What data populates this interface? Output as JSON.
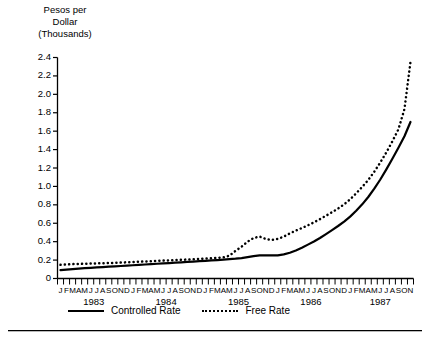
{
  "chart_data": {
    "type": "line",
    "title": "",
    "ylabel": "Pesos per Dollar (Thousands)",
    "ylabel_lines": "Pesos per\nDollar\n(Thousands)",
    "xlabel": "",
    "ylim": [
      0,
      2.4
    ],
    "ytick_labels": [
      "2.4",
      "2.2",
      "2.0",
      "1.8",
      "1.6",
      "1.4",
      "1.2",
      "1.0",
      "0.8",
      "0.6",
      "0.4",
      "0.2",
      "0"
    ],
    "ytick_values": [
      2.4,
      2.2,
      2.0,
      1.8,
      1.6,
      1.4,
      1.2,
      1.0,
      0.8,
      0.6,
      0.4,
      0.2,
      0
    ],
    "grid": false,
    "legend_position": "bottom",
    "month_letters": [
      "J",
      "F",
      "M",
      "A",
      "M",
      "J",
      "J",
      "A",
      "S",
      "O",
      "N",
      "D"
    ],
    "years": [
      "1983",
      "1984",
      "1985",
      "1986",
      "1987"
    ],
    "x_start": "1983-01",
    "x_end": "1987-11",
    "n_points": 59,
    "series": [
      {
        "name": "Controlled Rate",
        "style": "solid",
        "color": "#000000",
        "values": [
          0.09,
          0.096,
          0.102,
          0.107,
          0.112,
          0.116,
          0.12,
          0.124,
          0.128,
          0.132,
          0.136,
          0.14,
          0.144,
          0.148,
          0.152,
          0.156,
          0.16,
          0.164,
          0.168,
          0.172,
          0.176,
          0.18,
          0.184,
          0.188,
          0.192,
          0.196,
          0.2,
          0.205,
          0.21,
          0.215,
          0.222,
          0.232,
          0.243,
          0.252,
          0.252,
          0.252,
          0.252,
          0.262,
          0.28,
          0.305,
          0.335,
          0.368,
          0.402,
          0.44,
          0.482,
          0.525,
          0.57,
          0.618,
          0.672,
          0.735,
          0.805,
          0.885,
          0.975,
          1.075,
          1.185,
          1.3,
          1.42,
          1.545,
          1.7
        ]
      },
      {
        "name": "Free Rate",
        "style": "dotted",
        "color": "#000000",
        "values": [
          0.148,
          0.152,
          0.156,
          0.158,
          0.16,
          0.162,
          0.164,
          0.166,
          0.168,
          0.17,
          0.173,
          0.176,
          0.179,
          0.182,
          0.185,
          0.188,
          0.191,
          0.194,
          0.197,
          0.2,
          0.203,
          0.206,
          0.209,
          0.212,
          0.216,
          0.22,
          0.224,
          0.23,
          0.248,
          0.3,
          0.345,
          0.4,
          0.44,
          0.455,
          0.43,
          0.418,
          0.43,
          0.455,
          0.49,
          0.52,
          0.548,
          0.578,
          0.61,
          0.645,
          0.682,
          0.72,
          0.76,
          0.805,
          0.86,
          0.925,
          0.995,
          1.07,
          1.16,
          1.26,
          1.37,
          1.49,
          1.62,
          1.84,
          2.35
        ]
      }
    ]
  },
  "legend": {
    "controlled_label": "Controlled Rate",
    "free_label": "Free Rate"
  }
}
